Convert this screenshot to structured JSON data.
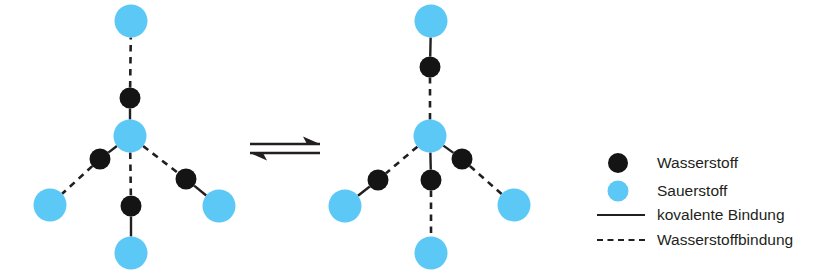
{
  "diagram": {
    "colors": {
      "hydrogen": "#141414",
      "oxygen": "#5BC8F5",
      "bond": "#231f20",
      "text": "#231f20",
      "background": "#ffffff"
    },
    "atom_radius": {
      "hydrogen": 10.5,
      "oxygen": 16.5
    },
    "bond_labels": {
      "covalent": "kovalente Bindung",
      "hydrogen_bond": "Wasserstoffbindung"
    }
  },
  "structures": [
    {
      "name": "left-water-cluster",
      "center": {
        "label": "Sauerstoff",
        "element": "O",
        "x": 130,
        "y": 136
      },
      "arms": [
        {
          "name": "top-arm",
          "hydrogen": {
            "element": "H",
            "x": 130,
            "y": 98
          },
          "oxygen": {
            "element": "O",
            "x": 131,
            "y": 21
          },
          "bond_center_to_h": "covalent",
          "bond_h_to_o": "hydrogen_bond"
        },
        {
          "name": "lower-left-arm",
          "hydrogen": {
            "element": "H",
            "x": 100,
            "y": 159
          },
          "oxygen": {
            "element": "O",
            "x": 50,
            "y": 205
          },
          "bond_center_to_h": "covalent",
          "bond_h_to_o": "hydrogen_bond"
        },
        {
          "name": "bottom-arm",
          "hydrogen": {
            "element": "H",
            "x": 131,
            "y": 206
          },
          "oxygen": {
            "element": "O",
            "x": 131,
            "y": 253
          },
          "bond_center_to_h": "hydrogen_bond",
          "bond_h_to_o": "covalent"
        },
        {
          "name": "lower-right-arm",
          "hydrogen": {
            "element": "H",
            "x": 186,
            "y": 179
          },
          "oxygen": {
            "element": "O",
            "x": 219,
            "y": 206
          },
          "bond_center_to_h": "hydrogen_bond",
          "bond_h_to_o": "covalent"
        }
      ]
    },
    {
      "name": "right-water-cluster",
      "center": {
        "label": "Sauerstoff",
        "element": "O",
        "x": 430,
        "y": 136
      },
      "arms": [
        {
          "name": "top-arm",
          "hydrogen": {
            "element": "H",
            "x": 430,
            "y": 67
          },
          "oxygen": {
            "element": "O",
            "x": 431,
            "y": 21
          },
          "bond_center_to_h": "hydrogen_bond",
          "bond_h_to_o": "covalent"
        },
        {
          "name": "lower-left-arm",
          "hydrogen": {
            "element": "H",
            "x": 378,
            "y": 180
          },
          "oxygen": {
            "element": "O",
            "x": 345,
            "y": 206
          },
          "bond_center_to_h": "hydrogen_bond",
          "bond_h_to_o": "covalent"
        },
        {
          "name": "bottom-arm",
          "hydrogen": {
            "element": "H",
            "x": 431,
            "y": 180
          },
          "oxygen": {
            "element": "O",
            "x": 431,
            "y": 253
          },
          "bond_center_to_h": "covalent",
          "bond_h_to_o": "hydrogen_bond"
        },
        {
          "name": "lower-right-arm",
          "hydrogen": {
            "element": "H",
            "x": 462,
            "y": 159
          },
          "oxygen": {
            "element": "O",
            "x": 514,
            "y": 205
          },
          "bond_center_to_h": "covalent",
          "bond_h_to_o": "hydrogen_bond"
        }
      ]
    }
  ],
  "equilibrium": {
    "name": "equilibrium-arrows",
    "x_start": 250,
    "x_end": 320,
    "y_top": 144,
    "y_bottom": 153,
    "forward_direction": "right",
    "reverse_direction": "left"
  },
  "legend": {
    "swatch_x": 618,
    "line_x_start": 597,
    "line_x_end": 645,
    "text_x": 657,
    "items": [
      {
        "id": "hydrogen",
        "label": "Wasserstoff",
        "marker": "filled-circle",
        "color": "#141414",
        "radius": 10,
        "y": 163
      },
      {
        "id": "oxygen",
        "label": "Sauerstoff",
        "marker": "filled-circle",
        "color": "#5BC8F5",
        "radius": 10.5,
        "y": 191
      },
      {
        "id": "covalent-bond",
        "label": "kovalente Bindung",
        "marker": "solid-line",
        "color": "#231f20",
        "y": 215
      },
      {
        "id": "hydrogen-bond",
        "label": "Wasserstoffbindung",
        "marker": "dashed-line",
        "color": "#231f20",
        "y": 240
      }
    ]
  }
}
